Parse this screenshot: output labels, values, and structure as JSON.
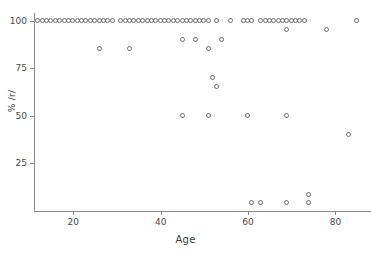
{
  "chart_data": {
    "type": "scatter",
    "title": "",
    "xlabel": "Age",
    "ylabel": "% /r/",
    "xlim": [
      11,
      87
    ],
    "ylim": [
      0,
      104
    ],
    "grid": false,
    "legend": null,
    "xticks": [
      20,
      40,
      60,
      80
    ],
    "yticks": [
      25,
      50,
      75,
      100
    ],
    "marker": "open-circle",
    "marker_color": "#6e6e7a",
    "series": [
      {
        "name": "speakers",
        "points": [
          [
            12,
            100
          ],
          [
            13,
            100
          ],
          [
            14,
            100
          ],
          [
            15,
            100
          ],
          [
            16,
            100
          ],
          [
            17,
            100
          ],
          [
            18,
            100
          ],
          [
            19,
            100
          ],
          [
            20,
            100
          ],
          [
            21,
            100
          ],
          [
            22,
            100
          ],
          [
            23,
            100
          ],
          [
            24,
            100
          ],
          [
            25,
            100
          ],
          [
            26,
            100
          ],
          [
            27,
            100
          ],
          [
            28,
            100
          ],
          [
            29,
            100
          ],
          [
            31,
            100
          ],
          [
            32,
            100
          ],
          [
            33,
            100
          ],
          [
            34,
            100
          ],
          [
            35,
            100
          ],
          [
            36,
            100
          ],
          [
            37,
            100
          ],
          [
            38,
            100
          ],
          [
            39,
            100
          ],
          [
            40,
            100
          ],
          [
            41,
            100
          ],
          [
            42,
            100
          ],
          [
            43,
            100
          ],
          [
            44,
            100
          ],
          [
            45,
            100
          ],
          [
            46,
            100
          ],
          [
            47,
            100
          ],
          [
            48,
            100
          ],
          [
            49,
            100
          ],
          [
            50,
            100
          ],
          [
            51,
            100
          ],
          [
            53,
            100
          ],
          [
            56,
            100
          ],
          [
            59,
            100
          ],
          [
            60,
            100
          ],
          [
            61,
            100
          ],
          [
            63,
            100
          ],
          [
            64,
            100
          ],
          [
            65,
            100
          ],
          [
            66,
            100
          ],
          [
            67,
            100
          ],
          [
            68,
            100
          ],
          [
            69,
            100
          ],
          [
            70,
            100
          ],
          [
            71,
            100
          ],
          [
            72,
            100
          ],
          [
            73,
            100
          ],
          [
            85,
            100
          ],
          [
            69,
            95
          ],
          [
            78,
            95
          ],
          [
            45,
            90
          ],
          [
            48,
            90
          ],
          [
            54,
            90
          ],
          [
            26,
            85
          ],
          [
            33,
            85
          ],
          [
            51,
            85
          ],
          [
            52,
            70
          ],
          [
            53,
            65
          ],
          [
            45,
            50
          ],
          [
            51,
            50
          ],
          [
            60,
            50
          ],
          [
            69,
            50
          ],
          [
            83,
            40
          ],
          [
            74,
            8
          ],
          [
            61,
            4
          ],
          [
            63,
            4
          ],
          [
            69,
            4
          ],
          [
            74,
            4
          ]
        ]
      }
    ]
  },
  "axes": {
    "x_title": "Age",
    "y_title": "% /r/",
    "x_tick_labels": [
      "20",
      "40",
      "60",
      "80"
    ],
    "y_tick_labels": [
      "25",
      "50",
      "75",
      "100"
    ]
  }
}
